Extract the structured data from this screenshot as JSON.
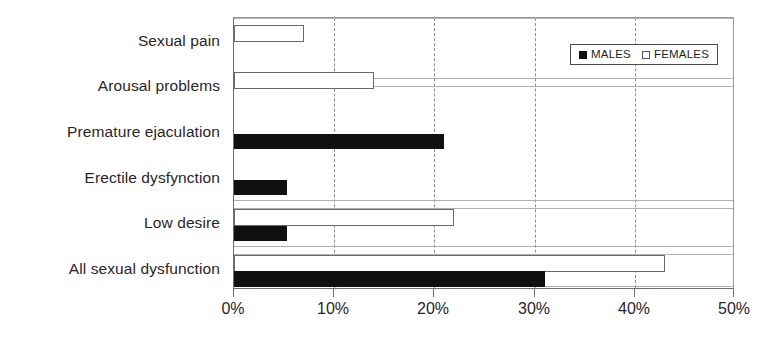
{
  "chart_data": {
    "type": "bar",
    "orientation": "horizontal",
    "title": "",
    "xlabel": "",
    "ylabel": "",
    "xlim": [
      0,
      50
    ],
    "xticks": [
      "0%",
      "10%",
      "20%",
      "30%",
      "40%",
      "50%"
    ],
    "xtick_values": [
      0,
      10,
      20,
      30,
      40,
      50
    ],
    "grid": "vertical-dashed",
    "legend_position": "top-right",
    "categories": [
      "Sexual pain",
      "Arousal problems",
      "Premature ejaculation",
      "Erectile dysfynction",
      "Low desire",
      "All sexual dysfunction"
    ],
    "series": [
      {
        "name": "MALES",
        "color": "#101010",
        "values": [
          0,
          0,
          21,
          5.3,
          5.3,
          31
        ]
      },
      {
        "name": "FEMALES",
        "color": "#ffffff",
        "values": [
          7,
          14,
          0,
          0,
          22,
          43
        ]
      }
    ]
  },
  "legend": {
    "items": [
      {
        "label": "MALES",
        "swatch": "filled-square-icon"
      },
      {
        "label": "FEMALES",
        "swatch": "empty-square-icon"
      }
    ]
  }
}
